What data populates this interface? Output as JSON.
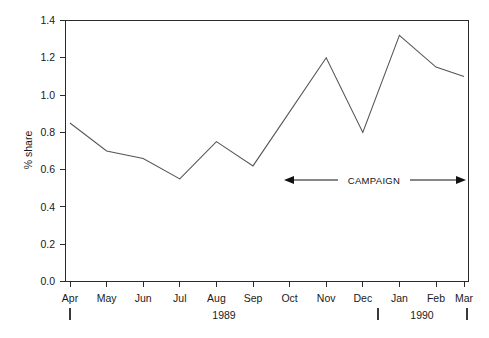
{
  "chart_data": {
    "type": "line",
    "title": "",
    "subtitle": "",
    "xlabel": "",
    "ylabel": "% share",
    "categories": [
      "Apr",
      "May",
      "Jun",
      "Jul",
      "Aug",
      "Sep",
      "Oct",
      "Nov",
      "Dec",
      "Jan",
      "Feb",
      "Mar"
    ],
    "values": [
      0.85,
      0.7,
      0.66,
      0.55,
      0.75,
      0.62,
      0.91,
      1.2,
      0.8,
      1.32,
      1.15,
      1.1
    ],
    "series": [
      {
        "name": "% share",
        "values": [
          0.85,
          0.7,
          0.66,
          0.55,
          0.75,
          0.62,
          0.91,
          1.2,
          0.8,
          1.32,
          1.15,
          1.1
        ]
      }
    ],
    "ylim": [
      0.0,
      1.4
    ],
    "ytick_labels": [
      "0.0",
      "0.2",
      "0.4",
      "0.6",
      "0.8",
      "1.0",
      "1.2",
      "1.4"
    ],
    "ytick_values": [
      0.0,
      0.2,
      0.4,
      0.6,
      0.8,
      1.0,
      1.2,
      1.4
    ],
    "grid": false,
    "legend": false,
    "legend_position": "none",
    "line_color": "#555555",
    "axis_color": "#2b2b2b",
    "background_color": "#ffffff",
    "year_groups": [
      {
        "label": "1989",
        "start_index": 0,
        "end_index": 8
      },
      {
        "label": "1990",
        "start_index": 9,
        "end_index": 11
      }
    ],
    "annotations": [
      {
        "text": "CAMPAIGN",
        "type": "double-arrow-span",
        "start_index": 6,
        "end_index": 11,
        "y_value": 0.58
      }
    ]
  },
  "axis": {
    "y_title": "% share"
  }
}
